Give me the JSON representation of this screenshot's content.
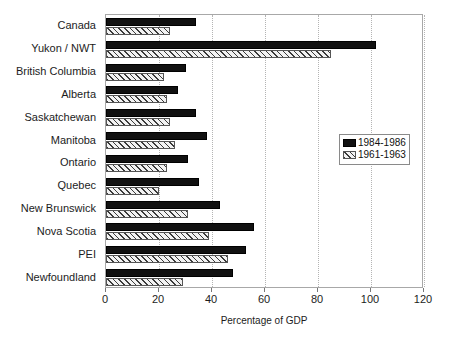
{
  "chart_data": {
    "type": "bar",
    "orientation": "horizontal",
    "title": "",
    "xlabel": "Percentage of GDP",
    "ylabel": "",
    "xlim": [
      0,
      120
    ],
    "xticks": [
      0,
      20,
      40,
      60,
      80,
      100,
      120
    ],
    "grid": true,
    "legend_position": "center-right",
    "categories": [
      "Canada",
      "Yukon / NWT",
      "British Columbia",
      "Alberta",
      "Saskatchewan",
      "Manitoba",
      "Ontario",
      "Quebec",
      "New Brunswick",
      "Nova  Scotia",
      "PEI",
      "Newfoundland"
    ],
    "series": [
      {
        "name": "1984-1986",
        "style": "solid-black",
        "color": "#111111",
        "values": [
          34,
          102,
          30,
          27,
          34,
          38,
          31,
          35,
          43,
          56,
          53,
          48
        ]
      },
      {
        "name": "1961-1963",
        "style": "diagonal-hatch",
        "color": "#3a3a3a",
        "values": [
          24,
          85,
          22,
          23,
          24,
          26,
          23,
          20,
          31,
          39,
          46,
          29
        ]
      }
    ]
  },
  "axis": {
    "x_tick_labels": [
      "0",
      "20",
      "40",
      "60",
      "80",
      "100",
      "120"
    ],
    "x_axis_title": "Percentage of GDP"
  },
  "legend": {
    "entries": [
      {
        "label": "1984-1986"
      },
      {
        "label": "1961-1963"
      }
    ]
  }
}
